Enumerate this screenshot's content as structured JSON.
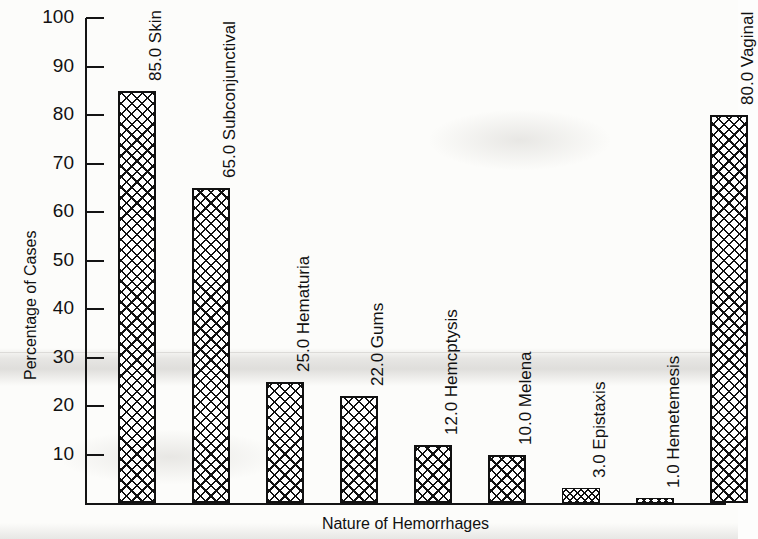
{
  "chart_data": {
    "type": "bar",
    "title": "",
    "xlabel": "Nature of Hemorrhages",
    "ylabel": "Percentage of Cases",
    "categories": [
      "Skin",
      "Subconjunctival",
      "Hematuria",
      "Gums",
      "Hemcptysis",
      "Melena",
      "Epistaxis",
      "Hemetemesis",
      "Vaginal"
    ],
    "values": [
      85.0,
      65.0,
      25.0,
      22.0,
      12.0,
      10.0,
      3.0,
      1.0,
      80.0
    ],
    "point_labels": [
      "85.0 Skin",
      "65.0 Subconjunctival",
      "25.0 Hematuria",
      "22.0 Gums",
      "12.0 Hemcptysis",
      "10.0 Melena",
      "3.0 Epistaxis",
      "1.0 Hemetemesis",
      "80.0 Vaginal"
    ],
    "ylim": [
      0,
      100
    ],
    "ytick_labels": [
      "100",
      "90",
      "80",
      "70",
      "60",
      "50",
      "40",
      "30",
      "20",
      "10"
    ],
    "ytick_values": [
      100,
      90,
      80,
      70,
      60,
      50,
      40,
      30,
      20,
      10
    ],
    "grid": false,
    "legend": false,
    "bar_fill": "crosshatch",
    "colors": {
      "ink": "#111111",
      "paper": "#fcfcfa",
      "bar_fill": "#ffffff"
    }
  }
}
